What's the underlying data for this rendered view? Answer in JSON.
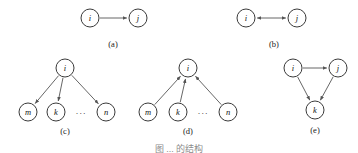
{
  "figure": {
    "caption": "图 ... 的结构",
    "background_color": "#ffffff",
    "node_fill": "#ffffff",
    "node_stroke": "#3a3a3a",
    "edge_color": "#555555",
    "label_color": "#141414"
  },
  "panels": [
    {
      "id": "a",
      "caption": "(a)",
      "caption_x": 113,
      "caption_y": 44,
      "nodes": [
        {
          "id": "i",
          "label": "i",
          "cx": 90,
          "cy": 18,
          "r": 9
        },
        {
          "id": "j",
          "label": "j",
          "cx": 138,
          "cy": 18,
          "r": 9
        }
      ],
      "edges": [
        {
          "from": "i",
          "to": "j",
          "arrow": "forward"
        }
      ],
      "ellipsis": null
    },
    {
      "id": "b",
      "caption": "(b)",
      "caption_x": 274,
      "caption_y": 44,
      "nodes": [
        {
          "id": "i",
          "label": "i",
          "cx": 246,
          "cy": 18,
          "r": 9
        },
        {
          "id": "j",
          "label": "j",
          "cx": 297,
          "cy": 18,
          "r": 9
        }
      ],
      "edges": [
        {
          "from": "i",
          "to": "j",
          "arrow": "both"
        }
      ],
      "ellipsis": null
    },
    {
      "id": "c",
      "caption": "(c)",
      "caption_x": 65,
      "caption_y": 131,
      "nodes": [
        {
          "id": "i",
          "label": "i",
          "cx": 65,
          "cy": 68,
          "r": 9
        },
        {
          "id": "m",
          "label": "m",
          "cx": 28,
          "cy": 112,
          "r": 9
        },
        {
          "id": "k",
          "label": "k",
          "cx": 56,
          "cy": 112,
          "r": 9
        },
        {
          "id": "n",
          "label": "n",
          "cx": 106,
          "cy": 112,
          "r": 9
        }
      ],
      "edges": [
        {
          "from": "i",
          "to": "m",
          "arrow": "forward"
        },
        {
          "from": "i",
          "to": "k",
          "arrow": "forward"
        },
        {
          "from": "i",
          "to": "n",
          "arrow": "forward"
        }
      ],
      "ellipsis": {
        "text": "···",
        "x": 81,
        "y": 113
      }
    },
    {
      "id": "d",
      "caption": "(d)",
      "caption_x": 188,
      "caption_y": 131,
      "nodes": [
        {
          "id": "i",
          "label": "i",
          "cx": 188,
          "cy": 68,
          "r": 9
        },
        {
          "id": "m",
          "label": "m",
          "cx": 148,
          "cy": 112,
          "r": 9
        },
        {
          "id": "k",
          "label": "k",
          "cx": 178,
          "cy": 112,
          "r": 9
        },
        {
          "id": "n",
          "label": "n",
          "cx": 228,
          "cy": 112,
          "r": 9
        }
      ],
      "edges": [
        {
          "from": "m",
          "to": "i",
          "arrow": "forward"
        },
        {
          "from": "k",
          "to": "i",
          "arrow": "forward"
        },
        {
          "from": "n",
          "to": "i",
          "arrow": "forward"
        }
      ],
      "ellipsis": {
        "text": "···",
        "x": 203,
        "y": 113
      }
    },
    {
      "id": "e",
      "caption": "(e)",
      "caption_x": 315,
      "caption_y": 130,
      "nodes": [
        {
          "id": "i",
          "label": "i",
          "cx": 293,
          "cy": 68,
          "r": 9
        },
        {
          "id": "j",
          "label": "j",
          "cx": 338,
          "cy": 68,
          "r": 9
        },
        {
          "id": "k",
          "label": "k",
          "cx": 315,
          "cy": 110,
          "r": 9
        }
      ],
      "edges": [
        {
          "from": "i",
          "to": "j",
          "arrow": "forward"
        },
        {
          "from": "i",
          "to": "k",
          "arrow": "forward"
        },
        {
          "from": "j",
          "to": "k",
          "arrow": "forward"
        }
      ],
      "ellipsis": null
    }
  ]
}
